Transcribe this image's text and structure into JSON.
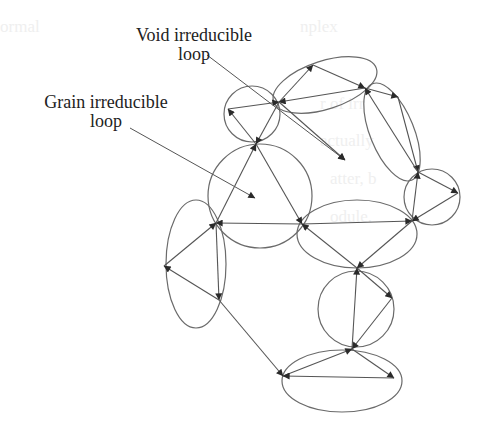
{
  "diagram": {
    "labels": {
      "void": {
        "line1": "Void irreducible",
        "line2": "loop"
      },
      "grain": {
        "line1": "Grain irreducible",
        "line2": "loop"
      }
    },
    "colors": {
      "stroke": "#555555",
      "text": "#222222",
      "background": "#ffffff"
    },
    "nodes": [
      {
        "id": "n_tl_left",
        "x": 228,
        "y": 109
      },
      {
        "id": "n_hub_top",
        "x": 279,
        "y": 102
      },
      {
        "id": "n_top_peak",
        "x": 313,
        "y": 65
      },
      {
        "id": "n_top_right",
        "x": 365,
        "y": 88
      },
      {
        "id": "n_right_upper",
        "x": 398,
        "y": 97
      },
      {
        "id": "n_right_mid",
        "x": 418,
        "y": 172
      },
      {
        "id": "n_right_far",
        "x": 458,
        "y": 193
      },
      {
        "id": "n_mid_right",
        "x": 412,
        "y": 221
      },
      {
        "id": "n_grain_top",
        "x": 256,
        "y": 144
      },
      {
        "id": "n_grain_right",
        "x": 302,
        "y": 224
      },
      {
        "id": "n_grain_left",
        "x": 216,
        "y": 223
      },
      {
        "id": "n_left_far",
        "x": 164,
        "y": 266
      },
      {
        "id": "n_left_bottom",
        "x": 219,
        "y": 300
      },
      {
        "id": "n_low_top",
        "x": 357,
        "y": 268
      },
      {
        "id": "n_low_right",
        "x": 392,
        "y": 298
      },
      {
        "id": "n_low_bottom",
        "x": 352,
        "y": 349
      },
      {
        "id": "n_bot_left",
        "x": 283,
        "y": 376
      },
      {
        "id": "n_bot_right",
        "x": 394,
        "y": 378
      }
    ],
    "loops": [
      {
        "id": "loop-small-top-left",
        "shape": "circle",
        "cx": 252,
        "cy": 114,
        "r": 28
      },
      {
        "id": "loop-top-ellipse",
        "shape": "ellipse",
        "cx": 325,
        "cy": 85,
        "rx": 54,
        "ry": 24,
        "rot": -18
      },
      {
        "id": "loop-right-tall",
        "shape": "ellipse",
        "cx": 392,
        "cy": 132,
        "rx": 22,
        "ry": 52,
        "rot": -22
      },
      {
        "id": "loop-right-small",
        "shape": "circle",
        "cx": 432,
        "cy": 197,
        "r": 28
      },
      {
        "id": "loop-grain-large",
        "shape": "circle",
        "cx": 260,
        "cy": 196,
        "r": 52
      },
      {
        "id": "loop-middle-ellipse",
        "shape": "ellipse",
        "cx": 357,
        "cy": 234,
        "rx": 60,
        "ry": 34,
        "rot": 0
      },
      {
        "id": "loop-left-ellipse",
        "shape": "ellipse",
        "cx": 196,
        "cy": 264,
        "rx": 30,
        "ry": 64,
        "rot": 0
      },
      {
        "id": "loop-lower-circle",
        "shape": "circle",
        "cx": 356,
        "cy": 309,
        "r": 38
      },
      {
        "id": "loop-bottom-ellipse",
        "shape": "ellipse",
        "cx": 342,
        "cy": 381,
        "rx": 60,
        "ry": 31,
        "rot": 0
      }
    ],
    "edges": [
      {
        "from": [
          228,
          109
        ],
        "to": [
          279,
          102
        ]
      },
      {
        "from": [
          256,
          144
        ],
        "to": [
          228,
          109
        ]
      },
      {
        "from": [
          279,
          102
        ],
        "to": [
          256,
          144
        ]
      },
      {
        "from": [
          279,
          102
        ],
        "to": [
          313,
          65
        ]
      },
      {
        "from": [
          313,
          65
        ],
        "to": [
          365,
          88
        ]
      },
      {
        "from": [
          365,
          88
        ],
        "to": [
          279,
          102
        ]
      },
      {
        "from": [
          365,
          88
        ],
        "to": [
          398,
          97
        ]
      },
      {
        "from": [
          398,
          97
        ],
        "to": [
          418,
          172
        ]
      },
      {
        "from": [
          418,
          172
        ],
        "to": [
          365,
          88
        ]
      },
      {
        "from": [
          418,
          172
        ],
        "to": [
          458,
          193
        ]
      },
      {
        "from": [
          458,
          193
        ],
        "to": [
          412,
          221
        ]
      },
      {
        "from": [
          412,
          221
        ],
        "to": [
          418,
          172
        ]
      },
      {
        "from": [
          256,
          144
        ],
        "to": [
          302,
          224
        ]
      },
      {
        "from": [
          302,
          224
        ],
        "to": [
          216,
          223
        ]
      },
      {
        "from": [
          216,
          223
        ],
        "to": [
          256,
          144
        ]
      },
      {
        "from": [
          302,
          224
        ],
        "to": [
          412,
          221
        ]
      },
      {
        "from": [
          412,
          221
        ],
        "to": [
          357,
          268
        ]
      },
      {
        "from": [
          357,
          268
        ],
        "to": [
          302,
          224
        ]
      },
      {
        "from": [
          216,
          223
        ],
        "to": [
          219,
          300
        ]
      },
      {
        "from": [
          219,
          300
        ],
        "to": [
          164,
          266
        ]
      },
      {
        "from": [
          164,
          266
        ],
        "to": [
          216,
          223
        ]
      },
      {
        "from": [
          219,
          300
        ],
        "to": [
          283,
          376
        ]
      },
      {
        "from": [
          357,
          268
        ],
        "to": [
          392,
          298
        ]
      },
      {
        "from": [
          392,
          298
        ],
        "to": [
          352,
          349
        ]
      },
      {
        "from": [
          352,
          349
        ],
        "to": [
          357,
          268
        ]
      },
      {
        "from": [
          283,
          376
        ],
        "to": [
          352,
          349
        ]
      },
      {
        "from": [
          352,
          349
        ],
        "to": [
          394,
          378
        ]
      },
      {
        "from": [
          394,
          378
        ],
        "to": [
          283,
          376
        ]
      },
      {
        "from": [
          279,
          102
        ],
        "to": [
          345,
          160
        ]
      }
    ],
    "leaders": [
      {
        "id": "void-leader",
        "from": [
          207,
          55
        ],
        "to": [
          345,
          160
        ]
      },
      {
        "id": "grain-leader",
        "from": [
          130,
          128
        ],
        "to": [
          255,
          198
        ]
      }
    ]
  }
}
